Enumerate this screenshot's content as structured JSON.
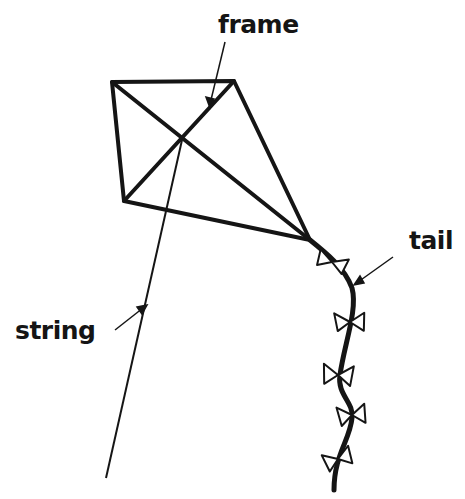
{
  "diagram": {
    "labels": {
      "frame": "frame",
      "tail": "tail",
      "string": "string"
    },
    "colors": {
      "stroke": "#151515",
      "background": "#ffffff"
    }
  }
}
